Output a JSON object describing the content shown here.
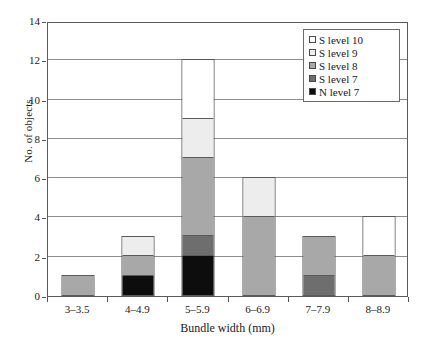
{
  "chart_data": {
    "type": "bar",
    "stacked": true,
    "title": "",
    "xlabel": "Bundle width (mm)",
    "ylabel": "No. of objects",
    "categories": [
      "3–3.5",
      "4–4.9",
      "5–5.9",
      "6–6.9",
      "7–7.9",
      "8–8.9"
    ],
    "ylim": [
      0,
      14
    ],
    "yticks": [
      0,
      2,
      4,
      6,
      8,
      10,
      12,
      14
    ],
    "grid": "horizontal",
    "legend_position": "top-right",
    "series": [
      {
        "name": "N level 7",
        "color": "#0d0d0d",
        "values": [
          0,
          1,
          2,
          0,
          0,
          0
        ]
      },
      {
        "name": "S level 7",
        "color": "#6e6e6e",
        "values": [
          0,
          0,
          1,
          0,
          1,
          0
        ]
      },
      {
        "name": "S level 8",
        "color": "#a8a8a8",
        "values": [
          1,
          1,
          4,
          4,
          2,
          2
        ]
      },
      {
        "name": "S level 9",
        "color": "#ededed",
        "values": [
          0,
          1,
          2,
          2,
          0,
          0
        ]
      },
      {
        "name": "S level 10",
        "color": "#ffffff",
        "values": [
          0,
          0,
          3,
          0,
          0,
          2
        ]
      }
    ],
    "totals": [
      1,
      3,
      12,
      6,
      3,
      4
    ],
    "legend": [
      {
        "label": "S level 10",
        "color": "#ffffff"
      },
      {
        "label": "S level 9",
        "color": "#ededed"
      },
      {
        "label": "S level 8",
        "color": "#a8a8a8"
      },
      {
        "label": "S level 7",
        "color": "#6e6e6e"
      },
      {
        "label": "N level 7",
        "color": "#0d0d0d"
      }
    ]
  }
}
